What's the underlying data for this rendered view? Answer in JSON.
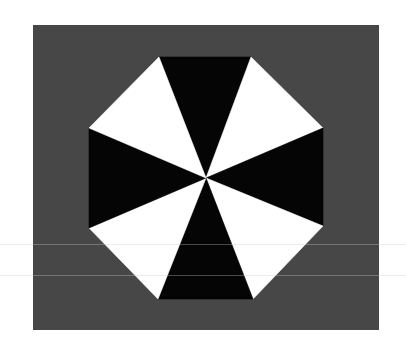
{
  "figure": {
    "colors": {
      "page_background": "#ffffff",
      "panel_background": "#474747",
      "sector_dark": "#050505",
      "sector_light": "#ffffff"
    },
    "panel": {
      "x": 33,
      "y": 25,
      "width": 346,
      "height": 305
    },
    "center": {
      "x": 206,
      "y": 178
    },
    "octagon_vertices": [
      [
        159,
        57
      ],
      [
        251,
        57
      ],
      [
        323,
        128
      ],
      [
        323,
        226
      ],
      [
        253,
        299
      ],
      [
        158,
        299
      ],
      [
        89,
        228
      ],
      [
        89,
        128
      ]
    ],
    "sectors": [
      {
        "name": "top",
        "color": "dark"
      },
      {
        "name": "top-right",
        "color": "light"
      },
      {
        "name": "right",
        "color": "dark"
      },
      {
        "name": "bottom-right",
        "color": "light"
      },
      {
        "name": "bottom",
        "color": "dark"
      },
      {
        "name": "bottom-left",
        "color": "light"
      },
      {
        "name": "left",
        "color": "dark"
      },
      {
        "name": "top-left",
        "color": "light"
      }
    ],
    "scan_lines_y": [
      244,
      275
    ]
  }
}
